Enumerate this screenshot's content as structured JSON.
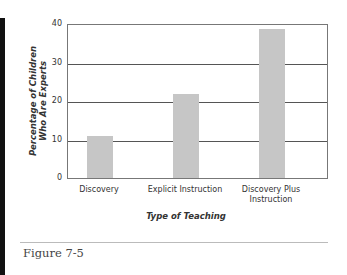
{
  "chart_data": {
    "type": "bar",
    "title": "",
    "categories": [
      "Discovery",
      "Explicit Instruction",
      "Discovery Plus Instruction"
    ],
    "category_lines": [
      [
        "Discovery"
      ],
      [
        "Explicit Instruction"
      ],
      [
        "Discovery Plus",
        "Instruction"
      ]
    ],
    "values": [
      11,
      22,
      39
    ],
    "xlabel": "Type of Teaching",
    "ylabel": "Percentage of Children Who Are Experts",
    "ylabel_lines": [
      "Percentage of Children",
      "Who Are Experts"
    ],
    "ylim": [
      0,
      40
    ],
    "yticks": [
      0,
      10,
      20,
      30,
      40
    ],
    "grid": true,
    "legend": null,
    "bar_color": "#c6c6c6"
  },
  "caption": "Figure 7-5"
}
